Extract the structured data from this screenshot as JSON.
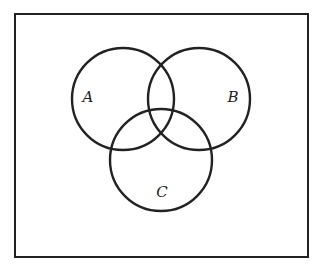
{
  "diagram": {
    "type": "venn",
    "universe": {
      "x": 15,
      "y": 14,
      "width": 293,
      "height": 243,
      "stroke": "#222222"
    },
    "sets": [
      {
        "label": "A",
        "cx": 123,
        "cy": 99,
        "r": 51,
        "label_x": 88,
        "label_y": 102
      },
      {
        "label": "B",
        "cx": 199,
        "cy": 99,
        "r": 51,
        "label_x": 233,
        "label_y": 102
      },
      {
        "label": "C",
        "cx": 161,
        "cy": 160,
        "r": 51,
        "label_x": 162,
        "label_y": 197
      }
    ],
    "stroke_color": "#222222"
  }
}
